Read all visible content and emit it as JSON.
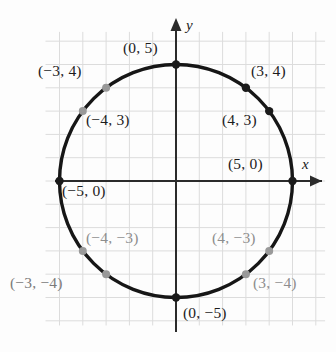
{
  "figure": {
    "background_color": "#fdfdfd",
    "grid_color": "#dcdcdc",
    "axis_color": "#2b2b2b",
    "curve_color": "#161616",
    "point_dark_color": "#1a1a1a",
    "point_grey_color": "#999999"
  },
  "axes": {
    "x_axis_label": "x",
    "y_axis_label": "y",
    "center_px": {
      "x": 176,
      "y": 181
    },
    "unit_px": 23.3,
    "x_range": [
      -5.6,
      6.4
    ],
    "y_range": [
      -6.2,
      6.4
    ],
    "grid": true
  },
  "chart_data": {
    "type": "scatter",
    "title": "",
    "subtitle": "",
    "xlabel": "x",
    "ylabel": "y",
    "xlim": [
      -5.6,
      6.4
    ],
    "ylim": [
      -6.2,
      6.4
    ],
    "grid": true,
    "legend": "none",
    "curve": {
      "name": "circle",
      "equation": "x^2 + y^2 = 25",
      "center": [
        0,
        0
      ],
      "radius": 5,
      "color": "#161616"
    },
    "points": [
      {
        "label": "(0, 5)",
        "x": 0,
        "y": 5,
        "marker": "dark",
        "label_color": "dark",
        "label_px": {
          "x": 123,
          "y": 40
        }
      },
      {
        "label": "(3, 4)",
        "x": 3,
        "y": 4,
        "marker": "dark",
        "label_color": "dark",
        "label_px": {
          "x": 251,
          "y": 63
        }
      },
      {
        "label": "(4, 3)",
        "x": 4,
        "y": 3,
        "marker": "dark",
        "label_color": "dark",
        "label_px": {
          "x": 222,
          "y": 112
        }
      },
      {
        "label": "(5, 0)",
        "x": 5,
        "y": 0,
        "marker": "dark",
        "label_color": "dark",
        "label_px": {
          "x": 228,
          "y": 156
        }
      },
      {
        "label": "(4, -3)",
        "x": 4,
        "y": -3,
        "marker": "grey",
        "label_color": "grey",
        "label_px": {
          "x": 212,
          "y": 230
        }
      },
      {
        "label": "(3, -4)",
        "x": 3,
        "y": -4,
        "marker": "grey",
        "label_color": "grey",
        "label_px": {
          "x": 253,
          "y": 275
        }
      },
      {
        "label": "(0, -5)",
        "x": 0,
        "y": -5,
        "marker": "dark",
        "label_color": "dark",
        "label_px": {
          "x": 183,
          "y": 305
        }
      },
      {
        "label": "(-3, -4)",
        "x": -3,
        "y": -4,
        "marker": "grey",
        "label_color": "midgrey",
        "label_px": {
          "x": 10,
          "y": 275
        }
      },
      {
        "label": "(-4, -3)",
        "x": -4,
        "y": -3,
        "marker": "grey",
        "label_color": "grey",
        "label_px": {
          "x": 86,
          "y": 230
        }
      },
      {
        "label": "(-5, 0)",
        "x": -5,
        "y": 0,
        "marker": "dark",
        "label_color": "dark",
        "label_px": {
          "x": 62,
          "y": 183
        }
      },
      {
        "label": "(-4, 3)",
        "x": -4,
        "y": 3,
        "marker": "grey",
        "label_color": "dark",
        "label_px": {
          "x": 86,
          "y": 112
        }
      },
      {
        "label": "(-3, 4)",
        "x": -3,
        "y": 4,
        "marker": "grey",
        "label_color": "dark",
        "label_px": {
          "x": 38,
          "y": 63
        }
      }
    ]
  }
}
